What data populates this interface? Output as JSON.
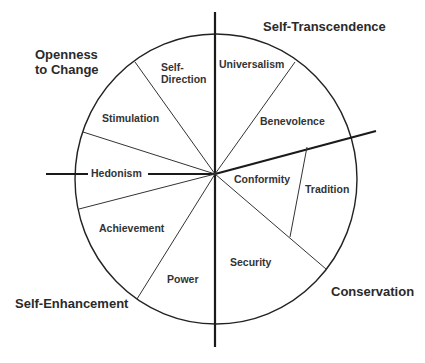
{
  "diagram": {
    "type": "circular-model",
    "colors": {
      "line": "#222222",
      "text": "#333333",
      "background": "#ffffff"
    },
    "groups": [
      {
        "id": "openness",
        "line1": "Openness",
        "line2": "to Change"
      },
      {
        "id": "self-transcendence",
        "label": "Self-Transcendence"
      },
      {
        "id": "self-enhancement",
        "label": "Self-Enhancement"
      },
      {
        "id": "conservation",
        "label": "Conservation"
      }
    ],
    "values": [
      {
        "id": "self-direction",
        "line1": "Self-",
        "line2": "Direction"
      },
      {
        "id": "universalism",
        "label": "Universalism"
      },
      {
        "id": "benevolence",
        "label": "Benevolence"
      },
      {
        "id": "stimulation",
        "label": "Stimulation"
      },
      {
        "id": "hedonism",
        "label": "Hedonism"
      },
      {
        "id": "conformity",
        "label": "Conformity"
      },
      {
        "id": "tradition",
        "label": "Tradition"
      },
      {
        "id": "achievement",
        "label": "Achievement"
      },
      {
        "id": "security",
        "label": "Security"
      },
      {
        "id": "power",
        "label": "Power"
      }
    ]
  }
}
